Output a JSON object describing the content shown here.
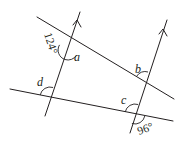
{
  "diagram": {
    "type": "geometry",
    "lines": {
      "parallel_left": {
        "x1": 45,
        "y1": 116,
        "x2": 80,
        "y2": 12
      },
      "parallel_right": {
        "x1": 130,
        "y1": 133,
        "x2": 167,
        "y2": 20
      },
      "transversal_upper": {
        "x1": 37,
        "y1": 17,
        "x2": 174,
        "y2": 99
      },
      "transversal_lower": {
        "x1": 10,
        "y1": 89,
        "x2": 173,
        "y2": 121
      }
    },
    "parallel_marker": "arrow",
    "angles": [
      {
        "label": "124°",
        "kind": "given",
        "vertex": "upper-left intersection",
        "position": "left of parallel line, below upper transversal"
      },
      {
        "label": "a",
        "kind": "unknown",
        "vertex": "upper-left intersection",
        "position": "right of parallel line, below upper transversal"
      },
      {
        "label": "b",
        "kind": "unknown",
        "vertex": "upper-right intersection",
        "position": "left of parallel line, above upper transversal"
      },
      {
        "label": "c",
        "kind": "unknown",
        "vertex": "lower-right intersection",
        "position": "left of parallel line, above lower transversal"
      },
      {
        "label": "d",
        "kind": "unknown",
        "vertex": "lower-left intersection",
        "position": "right of parallel line, above lower transversal"
      },
      {
        "label": "96°",
        "kind": "given",
        "vertex": "lower-right intersection",
        "position": "right of parallel line, below lower transversal"
      }
    ]
  },
  "labels": {
    "a": "a",
    "b": "b",
    "c": "c",
    "d": "d",
    "angle_124": "124°",
    "angle_96": "96°"
  },
  "colors": {
    "ink": "#231f20",
    "background": "#ffffff"
  }
}
